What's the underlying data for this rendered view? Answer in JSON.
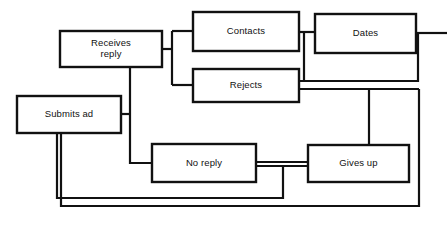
{
  "diagram": {
    "type": "flowchart",
    "background_color": "#ffffff",
    "line_color": "#111111",
    "box_fill_color": "#ffffff",
    "nodes": [
      {
        "id": "submits-ad",
        "label": "Submits ad",
        "label_lines": [
          "Submits ad"
        ],
        "x": 17,
        "y": 96,
        "width": 104,
        "height": 37
      },
      {
        "id": "receives-reply",
        "label": "Receives reply",
        "label_lines": [
          "Receives",
          "reply"
        ],
        "x": 60,
        "y": 31,
        "width": 102,
        "height": 36
      },
      {
        "id": "contacts",
        "label": "Contacts",
        "label_lines": [
          "Contacts"
        ],
        "x": 193,
        "y": 12,
        "width": 106,
        "height": 39
      },
      {
        "id": "dates",
        "label": "Dates",
        "label_lines": [
          "Dates"
        ],
        "x": 315,
        "y": 14,
        "width": 101,
        "height": 39
      },
      {
        "id": "rejects",
        "label": "Rejects",
        "label_lines": [
          "Rejects"
        ],
        "x": 193,
        "y": 69,
        "width": 106,
        "height": 33
      },
      {
        "id": "no-reply",
        "label": "No reply",
        "label_lines": [
          "No reply"
        ],
        "x": 152,
        "y": 144,
        "width": 104,
        "height": 38
      },
      {
        "id": "gives-up",
        "label": "Gives up",
        "label_lines": [
          "Gives up"
        ],
        "x": 308,
        "y": 145,
        "width": 101,
        "height": 37
      }
    ],
    "edges": [
      {
        "id": "receives-to-branch",
        "from": "receives-reply",
        "to": "branch-point",
        "path": "M162,49 L172,49"
      },
      {
        "id": "branch-vertical",
        "from": "branch-point",
        "to": "contacts-rejects",
        "path": "M172,31 L172,85"
      },
      {
        "id": "branch-to-contacts",
        "from": "branch-point",
        "to": "contacts",
        "path": "M172,31 L193,31"
      },
      {
        "id": "branch-to-rejects",
        "from": "branch-point",
        "to": "rejects",
        "path": "M172,85 L193,85"
      },
      {
        "id": "contacts-to-dates",
        "from": "contacts",
        "to": "dates",
        "path": "M299,32 L315,32"
      },
      {
        "id": "contacts-down-to-rejects",
        "from": "contacts",
        "to": "rejects",
        "path": "M304,32 L304,81 L299,81"
      },
      {
        "id": "dates-right-stub",
        "from": "dates",
        "to": "right-edge",
        "path": "M416,33 L447,33"
      },
      {
        "id": "dates-down-loop",
        "from": "dates",
        "to": "rejects-line",
        "path": "M418,33 L418,81 L299,81"
      },
      {
        "id": "rejects-right-lower",
        "from": "rejects",
        "to": "outer-right",
        "path": "M299,89 L419,89"
      },
      {
        "id": "rejects-to-gives-up",
        "from": "rejects",
        "to": "gives-up",
        "path": "M369,89 L369,145"
      },
      {
        "id": "receives-down",
        "from": "receives-reply",
        "to": "no-reply",
        "path": "M130,67 L130,163 L152,163"
      },
      {
        "id": "submits-to-vertical",
        "from": "submits-ad",
        "to": "receives-down",
        "path": "M121,114 L130,114"
      },
      {
        "id": "no-reply-to-gives-up",
        "from": "no-reply",
        "to": "gives-up",
        "path": "M256,162 L308,162"
      },
      {
        "id": "no-reply-to-gives-up-2",
        "from": "no-reply",
        "to": "gives-up",
        "path": "M256,166 L308,166"
      },
      {
        "id": "no-reply-return-loop",
        "from": "no-reply",
        "to": "submits-ad",
        "path": "M283,166 L283,198 L57,198 L57,133"
      },
      {
        "id": "gives-up-return-loop",
        "from": "gives-up",
        "to": "submits-ad",
        "path": "M419,89 L419,206 L61,206 L61,133"
      }
    ]
  }
}
